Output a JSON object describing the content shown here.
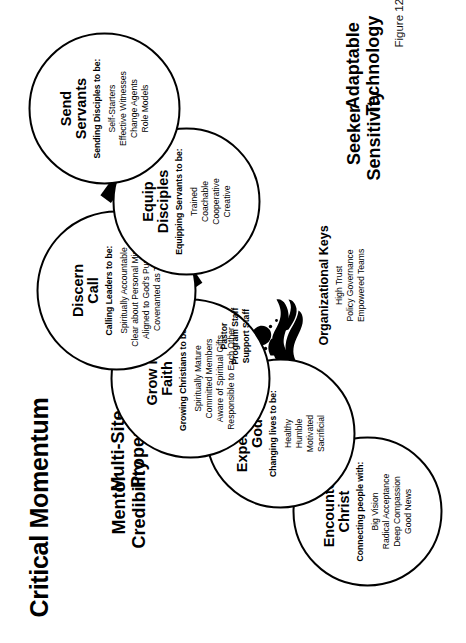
{
  "page": {
    "title": "Critical Momentum",
    "figure_caption": "Figure 12.1."
  },
  "corner_labels": [
    {
      "name": "mentor-credibility",
      "line1": "Mentor",
      "line2": "Credibility"
    },
    {
      "name": "multi-site-property",
      "line1": "Multi-Site",
      "line2": "Property"
    },
    {
      "name": "seeker-sensitivity",
      "line1": "Seeker",
      "line2": "Sensitivity"
    },
    {
      "name": "adaptable-technology",
      "line1": "Adaptable",
      "line2": "Technology"
    }
  ],
  "circles": [
    {
      "id": "encounter-christ",
      "title_line1": "Encounter",
      "title_line2": "Christ",
      "subtitle": "Connecting people with:",
      "items": [
        "Big Vision",
        "Radical Acceptance",
        "Deep Compassion",
        "Good News"
      ]
    },
    {
      "id": "experience-god",
      "title_line1": "Experience",
      "title_line2": "God",
      "subtitle": "Changing lives to be:",
      "items": [
        "Healthy",
        "Humble",
        "Motivated",
        "Sacrificial"
      ]
    },
    {
      "id": "grow-in-faith",
      "title_line1": "Grow in",
      "title_line2": "Faith",
      "subtitle": "Growing Christians to be:",
      "items": [
        "Spiritually Mature",
        "Committed Members",
        "Aware of Spiritual Gifts",
        "Responsible to Each Other"
      ]
    },
    {
      "id": "discern-call",
      "title_line1": "Discern",
      "title_line2": "Call",
      "subtitle": "Calling Leaders to be:",
      "items": [
        "Spiritually Accountable",
        "Clear about Personal Mission",
        "Aligned to God's Purpose",
        "Covenanted as Team"
      ]
    },
    {
      "id": "equip-disciples",
      "title_line1": "Equip",
      "title_line2": "Disciples",
      "subtitle": "Equipping Servants to be:",
      "items": [
        "Trained",
        "Coachable",
        "Cooperative",
        "Creative"
      ]
    },
    {
      "id": "send-servants",
      "title_line1": "Send",
      "title_line2": "Servants",
      "subtitle": "Sending Disciples to be:",
      "items": [
        "Self-Starters",
        "Effective Witnesses",
        "Change Agents",
        "Role Models"
      ]
    }
  ],
  "staff_roles": [
    "Pastor",
    "Program Staff",
    "Support Staff"
  ],
  "organizational_keys": {
    "title": "Organizational Keys",
    "items": [
      "High Trust",
      "Policy Governance",
      "Empowered Teams"
    ]
  },
  "colors": {
    "ink": "#000000",
    "page_background": "#ffffff"
  }
}
